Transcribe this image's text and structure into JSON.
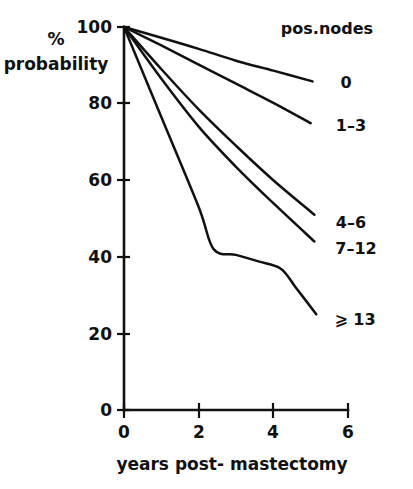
{
  "chart_data": {
    "type": "line",
    "title": "",
    "subtitle": "",
    "xlabel": "years post- mastectomy",
    "ylabel_line1": "%",
    "ylabel_line2": "probability",
    "legend_title": "pos.nodes",
    "legend_position": "right",
    "grid": false,
    "xlim": [
      0,
      6
    ],
    "ylim": [
      0,
      100
    ],
    "xticks": [
      0,
      2,
      4,
      6
    ],
    "xtick_labels": [
      "0",
      "2",
      "4",
      "6"
    ],
    "yticks": [
      0,
      20,
      40,
      60,
      80,
      100
    ],
    "ytick_labels": [
      "0",
      "20",
      "40",
      "60",
      "80",
      "100"
    ],
    "series": [
      {
        "name": "0",
        "label": "0",
        "x": [
          0,
          1,
          2,
          3,
          4,
          5.05
        ],
        "values": [
          100,
          97.2,
          94.3,
          91.2,
          88.6,
          85.8
        ]
      },
      {
        "name": "1-3",
        "label": "1–3",
        "x": [
          0,
          1,
          2,
          3,
          4,
          5.0
        ],
        "values": [
          100,
          95.2,
          90.2,
          85.2,
          80.2,
          74.9
        ]
      },
      {
        "name": "4-6",
        "label": "4–6",
        "x": [
          0,
          1,
          2,
          3,
          4,
          5.1
        ],
        "values": [
          100,
          89.0,
          78.5,
          69.0,
          60.0,
          51.0
        ]
      },
      {
        "name": "7-12",
        "label": "7–12",
        "x": [
          0,
          1,
          2,
          3,
          4,
          5.1
        ],
        "values": [
          100,
          86.5,
          74.0,
          63.5,
          54.0,
          44.0
        ]
      },
      {
        "name": ">=13",
        "label": "⩾ 13",
        "x": [
          0,
          1,
          2,
          2.4,
          3,
          3.6,
          4.2,
          4.6,
          5.15
        ],
        "values": [
          100,
          76.5,
          53.0,
          42.0,
          40.5,
          38.8,
          36.9,
          32.0,
          25.0
        ]
      }
    ],
    "legend_entries": [
      {
        "label": "0"
      },
      {
        "label": "1–3"
      },
      {
        "label": "4–6"
      },
      {
        "label": "7–12"
      },
      {
        "label": "⩾ 13"
      }
    ],
    "colors": {
      "line": "#111111",
      "axis": "#111111",
      "background": "#ffffff"
    }
  }
}
